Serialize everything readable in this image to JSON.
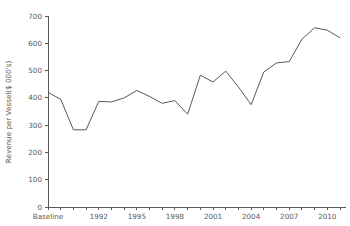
{
  "chart_data": {
    "type": "line",
    "title": "",
    "xlabel": "",
    "ylabel": "Revenue per Vessel($ 000's)",
    "ylim": [
      0,
      700
    ],
    "ytick_values": [
      0,
      100,
      200,
      300,
      400,
      500,
      600,
      700
    ],
    "ytick_labels": [
      "0",
      "100",
      "200",
      "300",
      "400",
      "500",
      "600",
      "700"
    ],
    "xtick_labels": [
      "Baseline",
      "1992",
      "1995",
      "1998",
      "2001",
      "2004",
      "2007",
      "2010"
    ],
    "xtick_indices": [
      0,
      4,
      7,
      10,
      13,
      16,
      19,
      22
    ],
    "grid": false,
    "legend": "none",
    "line_color": "#58595b",
    "categories": [
      "Baseline",
      "1989",
      "1990",
      "1991",
      "1992",
      "1993",
      "1994",
      "1995",
      "1996",
      "1997",
      "1998",
      "1999",
      "2000",
      "2001",
      "2002",
      "2003",
      "2004",
      "2005",
      "2006",
      "2007",
      "2008",
      "2009",
      "2010",
      "2011"
    ],
    "values": [
      420,
      395,
      283,
      283,
      387,
      385,
      400,
      427,
      405,
      380,
      390,
      340,
      483,
      458,
      498,
      440,
      375,
      495,
      528,
      533,
      615,
      657,
      648,
      620
    ]
  }
}
